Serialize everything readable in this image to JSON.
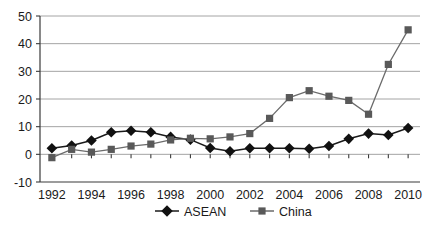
{
  "chart_data": {
    "type": "line",
    "title": "",
    "subtitle": "",
    "xlabel": "",
    "ylabel": "",
    "x": [
      1992,
      1993,
      1994,
      1995,
      1996,
      1997,
      1998,
      1999,
      2000,
      2001,
      2002,
      2003,
      2004,
      2005,
      2006,
      2007,
      2008,
      2009,
      2010
    ],
    "xtick_labels": [
      "1992",
      "1994",
      "1996",
      "1998",
      "2000",
      "2002",
      "2004",
      "2006",
      "2008",
      "2010"
    ],
    "xtick_values": [
      1992,
      1994,
      1996,
      1998,
      2000,
      2002,
      2004,
      2006,
      2008,
      2010
    ],
    "ytick_labels": [
      "-10",
      "0",
      "10",
      "20",
      "30",
      "40",
      "50"
    ],
    "ytick_values": [
      -10,
      0,
      10,
      20,
      30,
      40,
      50
    ],
    "xlim": [
      1991.4,
      2010.6
    ],
    "ylim": [
      -10,
      50
    ],
    "grid": "horizontal",
    "legend_position": "bottom-center",
    "series": [
      {
        "name": "ASEAN",
        "color": "#1a1a1a",
        "marker": "diamond",
        "marker_color": "#111111",
        "values": [
          2.2,
          3.2,
          5.0,
          8.0,
          8.5,
          8.0,
          6.3,
          5.3,
          2.3,
          1.1,
          2.2,
          2.2,
          2.2,
          2.0,
          3.0,
          5.6,
          7.5,
          7.0,
          9.5
        ]
      },
      {
        "name": "China",
        "color": "#6b6b6b",
        "marker": "square",
        "marker_color": "#595959",
        "values": [
          -1.2,
          1.8,
          0.8,
          1.8,
          3.0,
          3.7,
          5.2,
          5.8,
          5.6,
          6.3,
          7.5,
          13.0,
          20.5,
          23.0,
          21.0,
          19.5,
          14.5,
          32.5,
          45.0
        ]
      }
    ]
  },
  "legend": {
    "items": [
      {
        "label": "ASEAN",
        "marker": "diamond"
      },
      {
        "label": "China",
        "marker": "square"
      }
    ]
  },
  "colors": {
    "asean": "#111111",
    "china": "#595959",
    "grid": "#9a9a9a",
    "axis": "#3a3a3a",
    "background": "#ffffff"
  }
}
